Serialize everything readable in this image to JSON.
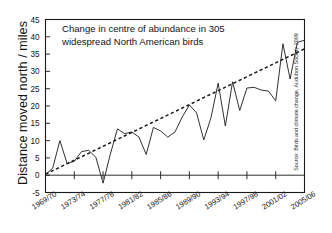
{
  "chart_data": {
    "type": "line",
    "title": "",
    "annotation": "Change in centre of abundance in 305 widespread North American birds",
    "annotation_line1": "Change in centre of abundance in 305",
    "annotation_line2": "widespread North American birds",
    "xlabel": "",
    "ylabel": "Distance moved north / miles",
    "source": "Source: Birds and climate change, Audubon Society 2009",
    "ylim": [
      -5,
      45
    ],
    "yticks": [
      -5,
      0,
      5,
      10,
      15,
      20,
      25,
      30,
      35,
      40,
      45
    ],
    "ytick_labels": [
      "-5",
      "0",
      "5",
      "10",
      "15",
      "20",
      "25",
      "30",
      "35",
      "40",
      "45"
    ],
    "xtick_labels": [
      "1969/70",
      "1973/74",
      "1977/78",
      "1981/82",
      "1985/86",
      "1989/90",
      "1993/94",
      "1997/98",
      "2001/02",
      "2005/06"
    ],
    "xtick_indices": [
      0,
      4,
      8,
      12,
      16,
      20,
      24,
      28,
      32,
      36
    ],
    "grid": false,
    "legend": "none",
    "x_categories": [
      "1969/70",
      "1970/71",
      "1971/72",
      "1972/73",
      "1973/74",
      "1974/75",
      "1975/76",
      "1976/77",
      "1977/78",
      "1978/79",
      "1979/80",
      "1980/81",
      "1981/82",
      "1982/83",
      "1983/84",
      "1984/85",
      "1985/86",
      "1986/87",
      "1987/88",
      "1988/89",
      "1989/90",
      "1990/91",
      "1991/92",
      "1992/93",
      "1993/94",
      "1994/95",
      "1995/96",
      "1996/97",
      "1997/98",
      "1998/99",
      "1999/00",
      "2000/01",
      "2001/02",
      "2002/03",
      "2003/04",
      "2004/05",
      "2005/06"
    ],
    "series": [
      {
        "name": "Distance moved north",
        "style": "solid",
        "values": [
          0.2,
          2.0,
          10.0,
          3.4,
          4.0,
          6.8,
          7.2,
          5.2,
          -2.3,
          6.0,
          13.4,
          12.0,
          12.5,
          11.0,
          6.0,
          13.8,
          12.8,
          11.0,
          12.5,
          16.8,
          20.3,
          18.0,
          10.2,
          16.6,
          26.6,
          14.2,
          27.0,
          18.7,
          25.2,
          25.4,
          24.6,
          24.3,
          21.5,
          38.0,
          27.8,
          38.4,
          39.0
        ]
      },
      {
        "name": "Trend",
        "style": "dashed",
        "values": [
          0.3,
          36.5
        ],
        "x_span": [
          0,
          36
        ]
      }
    ]
  }
}
